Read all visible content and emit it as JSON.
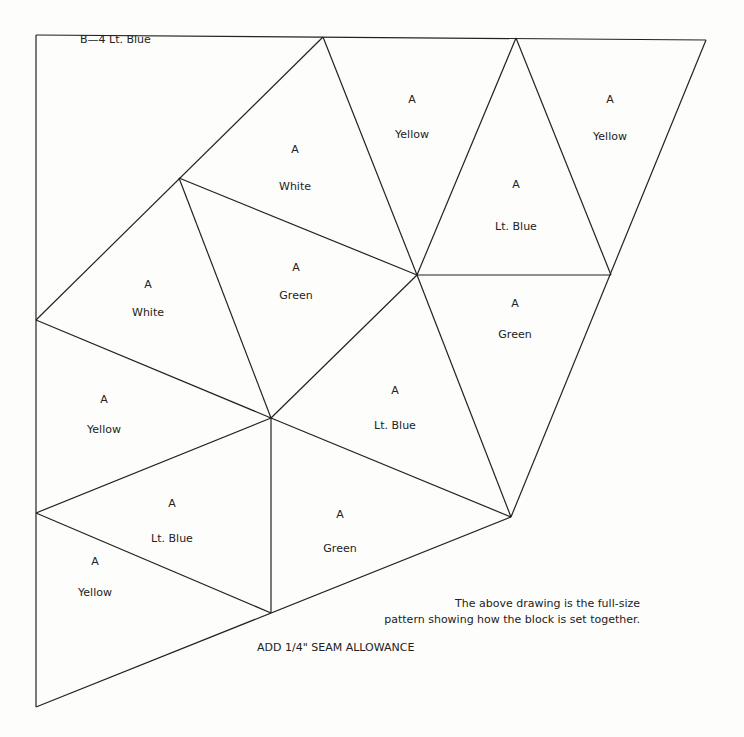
{
  "title": "B—4 Lt. Blue",
  "pieces": [
    {
      "id": "p1",
      "letter": "A",
      "color": "White",
      "x": 295,
      "y1": 150,
      "y2": 187
    },
    {
      "id": "p2",
      "letter": "A",
      "color": "Yellow",
      "x": 412,
      "y1": 100,
      "y2": 135
    },
    {
      "id": "p3",
      "letter": "A",
      "color": "Yellow",
      "x": 610,
      "y1": 100,
      "y2": 137
    },
    {
      "id": "p4",
      "letter": "A",
      "color": "Lt. Blue",
      "x": 516,
      "y1": 185,
      "y2": 227
    },
    {
      "id": "p5",
      "letter": "A",
      "color": "White",
      "x": 148,
      "y1": 285,
      "y2": 313
    },
    {
      "id": "p6",
      "letter": "A",
      "color": "Green",
      "x": 296,
      "y1": 268,
      "y2": 296
    },
    {
      "id": "p7",
      "letter": "A",
      "color": "Green",
      "x": 515,
      "y1": 304,
      "y2": 335
    },
    {
      "id": "p8",
      "letter": "A",
      "color": "Yellow",
      "x": 104,
      "y1": 400,
      "y2": 430
    },
    {
      "id": "p9",
      "letter": "A",
      "color": "Lt. Blue",
      "x": 395,
      "y1": 391,
      "y2": 426
    },
    {
      "id": "p10",
      "letter": "A",
      "color": "Lt. Blue",
      "x": 172,
      "y1": 504,
      "y2": 539
    },
    {
      "id": "p11",
      "letter": "A",
      "color": "Green",
      "x": 340,
      "y1": 515,
      "y2": 549
    },
    {
      "id": "p12",
      "letter": "A",
      "color": "Yellow",
      "x": 95,
      "y1": 562,
      "y2": 593
    }
  ],
  "note_line1": "The above drawing is the full-size",
  "note_line2": "pattern showing how the block is set together.",
  "seam_allowance": "ADD 1/4\" SEAM ALLOWANCE"
}
